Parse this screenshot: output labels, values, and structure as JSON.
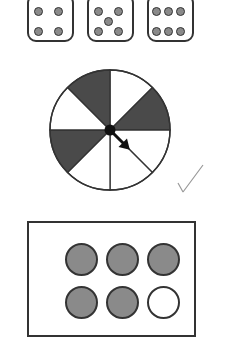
{
  "dice": [
    {
      "value": 4,
      "pips": [
        [
          9,
          9
        ],
        [
          29,
          9
        ],
        [
          9,
          29
        ],
        [
          29,
          29
        ]
      ]
    },
    {
      "value": 5,
      "pips": [
        [
          9,
          9
        ],
        [
          29,
          9
        ],
        [
          19,
          19
        ],
        [
          9,
          29
        ],
        [
          29,
          29
        ]
      ]
    },
    {
      "value": 6,
      "pips": [
        [
          7,
          9
        ],
        [
          19,
          9
        ],
        [
          31,
          9
        ],
        [
          7,
          29
        ],
        [
          19,
          29
        ],
        [
          31,
          29
        ]
      ]
    }
  ],
  "spinner": {
    "sections": 8,
    "shaded_sections": [
      1,
      5,
      7
    ],
    "shaded_count": 3,
    "arrow_angle_deg": 135,
    "shade_color": "#4a4a4a"
  },
  "counters": {
    "total": 6,
    "shaded": 5,
    "items": [
      "shaded",
      "shaded",
      "shaded",
      "shaded",
      "shaded",
      "unshaded"
    ],
    "shade_color": "#8a8a8a"
  },
  "checkmark": "✓"
}
